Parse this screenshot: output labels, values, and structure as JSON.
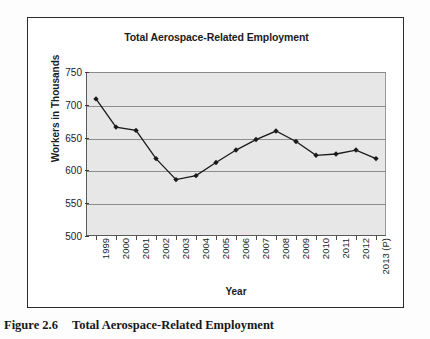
{
  "figure": {
    "caption_number": "Figure 2.6",
    "caption_text": "Total Aerospace-Related Employment"
  },
  "chart_data": {
    "type": "line",
    "title": "Total Aerospace-Related Employment",
    "xlabel": "Year",
    "ylabel": "Workers in Thousands",
    "categories": [
      "1999",
      "2000",
      "2001",
      "2002",
      "2003",
      "2004",
      "2005",
      "2006",
      "2007",
      "2008",
      "2009",
      "2010",
      "2011",
      "2012",
      "2013 (P)"
    ],
    "values": [
      709,
      666,
      661,
      618,
      586,
      592,
      612,
      631,
      647,
      660,
      644,
      623,
      625,
      631,
      618
    ],
    "series": [
      {
        "name": "Total Aerospace-Related Employment",
        "values": [
          709,
          666,
          661,
          618,
          586,
          592,
          612,
          631,
          647,
          660,
          644,
          623,
          625,
          631,
          618
        ]
      }
    ],
    "ylim": [
      500,
      750
    ],
    "yticks": [
      500,
      550,
      600,
      650,
      700,
      750
    ],
    "ytick_labels": [
      "500",
      "550",
      "600",
      "650",
      "700",
      "750"
    ],
    "grid": true,
    "legend": false,
    "legend_position": "none",
    "marker": "diamond",
    "line_color": "#1a1a1a",
    "marker_color": "#1a1a1a",
    "plot_background": "#e7e7e7",
    "gridline_color": "#8d8d8d"
  }
}
